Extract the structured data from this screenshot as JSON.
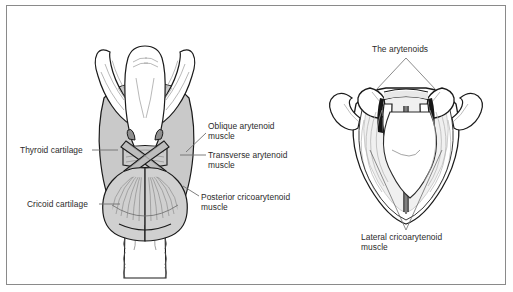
{
  "figure": {
    "views": [
      {
        "name": "posterior-view",
        "description": "Posterior view of the larynx showing the thyroid cartilage, cricoid cartilage and the posterior laryngeal muscles"
      },
      {
        "name": "superior-view",
        "description": "Superior view of the larynx showing the arytenoid cartilages and lateral cricoarytenoid muscles"
      }
    ]
  },
  "labels": {
    "thyroid_cartilage": "Thyroid cartilage",
    "cricoid_cartilage": "Cricoid cartilage",
    "oblique_arytenoid": "Oblique arytenoid\nmuscle",
    "transverse_arytenoid": "Transverse arytenoid\nmuscle",
    "posterior_cricoarytenoid": "Posterior cricoarytenoid\nmuscle",
    "the_arytenoids": "The arytenoids",
    "lateral_cricoarytenoid": "Lateral cricoarytenoid\nmuscle"
  },
  "colors": {
    "frame": "#8a8a8a",
    "text": "#2b2b2b",
    "outline": "#1a1a1a",
    "cartilage_fill": "#ffffff",
    "muscle_fill": "#c9c9c9",
    "shadow_fill": "#bdbdbd",
    "leader": "#6f6f6f",
    "background": "#ffffff"
  }
}
